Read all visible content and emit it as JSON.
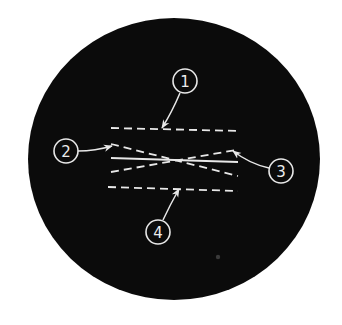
{
  "diagram": {
    "title": "",
    "field_of_view": {
      "cx": 174,
      "cy": 159,
      "rx": 146,
      "ry": 141,
      "fill": "#0b0b0b"
    },
    "line_color": "#e8e8e8",
    "lines": [
      {
        "id": "top-dashed",
        "style": "dashed",
        "x1": 111,
        "y1": 128,
        "x2": 240,
        "y2": 131
      },
      {
        "id": "descending-dashed",
        "style": "dashed",
        "x1": 111,
        "y1": 144,
        "x2": 238,
        "y2": 176
      },
      {
        "id": "solid-center",
        "style": "solid",
        "x1": 111,
        "y1": 158,
        "x2": 238,
        "y2": 162
      },
      {
        "id": "ascending-dashed",
        "style": "dashed",
        "x1": 111,
        "y1": 172,
        "x2": 236,
        "y2": 150
      },
      {
        "id": "bottom-dashed",
        "style": "dashed",
        "x1": 108,
        "y1": 187,
        "x2": 238,
        "y2": 191
      }
    ],
    "callouts": [
      {
        "number": "1",
        "cx": 185,
        "cy": 81,
        "r": 12,
        "leader": "M180,93 Q172,112 162,128",
        "tip": [
          162,
          128
        ]
      },
      {
        "number": "2",
        "cx": 66,
        "cy": 151,
        "r": 12,
        "leader": "M78,151 Q95,151 112,146",
        "tip": [
          112,
          146
        ]
      },
      {
        "number": "3",
        "cx": 281,
        "cy": 171,
        "r": 12,
        "leader": "M269,168 Q250,164 233,151",
        "tip": [
          233,
          151
        ]
      },
      {
        "number": "4",
        "cx": 158,
        "cy": 232,
        "r": 12,
        "leader": "M163,220 Q170,205 179,189",
        "tip": [
          179,
          189
        ]
      }
    ],
    "crossing_point": {
      "x": 172,
      "y": 160
    },
    "speck": {
      "x": 218,
      "y": 257
    }
  }
}
